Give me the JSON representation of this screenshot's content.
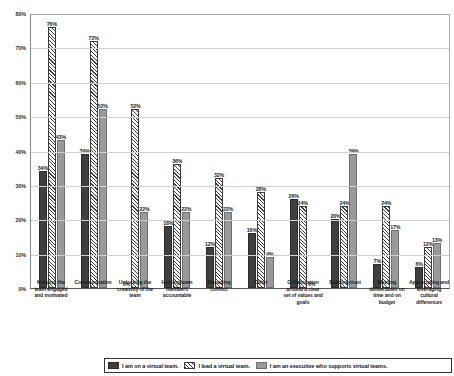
{
  "chart_data": {
    "type": "bar",
    "title": "",
    "subtitle": "",
    "xlabel": "",
    "ylabel": "",
    "ylim": [
      0,
      80
    ],
    "grid": true,
    "legend_position": "bottom",
    "y_ticks": [
      "0%",
      "10%",
      "20%",
      "30%",
      "40%",
      "50%",
      "60%",
      "70%",
      "80%"
    ],
    "y_tick_values": [
      0,
      10,
      20,
      30,
      40,
      50,
      60,
      70,
      80
    ],
    "categories": [
      "Keeping the team engaged and motivated",
      "Communication",
      "Unlocking the creativity of the team",
      "Holding team members accountable",
      "Managing conflict",
      "Other",
      "Collaboration around a clear set of values and goals",
      "Building trust",
      "Meeting deliverables on time and on budget",
      "Appreciating and leveraging cultural differences"
    ],
    "series": [
      {
        "name": "I am on a virtual team.",
        "style": "solid-dark",
        "color": "#3f3f3f",
        "values": [
          34,
          39,
          0,
          18,
          12,
          16,
          26,
          20,
          7,
          6
        ],
        "labels": [
          "34%",
          "39%",
          "0%",
          "18%",
          "12%",
          "16%",
          "26%",
          "20%",
          "7%",
          "6%"
        ]
      },
      {
        "name": "I lead a virtual team.",
        "style": "hatched",
        "color": "#ffffff",
        "values": [
          76,
          72,
          52,
          36,
          32,
          28,
          24,
          24,
          24,
          12
        ],
        "labels": [
          "76%",
          "72%",
          "52%",
          "36%",
          "32%",
          "28%",
          "24%",
          "24%",
          "24%",
          "12%"
        ]
      },
      {
        "name": "I am an executive who supports virtual teams.",
        "style": "solid-gray",
        "color": "#9a9a9a",
        "values": [
          43,
          52,
          22,
          22,
          22,
          9,
          0,
          39,
          17,
          13
        ],
        "labels": [
          "43%",
          "52%",
          "22%",
          "22%",
          "22%",
          "9%",
          "0%",
          "39%",
          "17%",
          "13%"
        ]
      }
    ]
  },
  "legend": {
    "items": [
      {
        "label": "I am on a virtual team.",
        "swatch": "solid-dark-swatch"
      },
      {
        "label": "I lead a virtual team.",
        "swatch": "hatched-swatch"
      },
      {
        "label": "I am an executive who supports virtual teams.",
        "swatch": "solid-gray-swatch"
      }
    ]
  }
}
